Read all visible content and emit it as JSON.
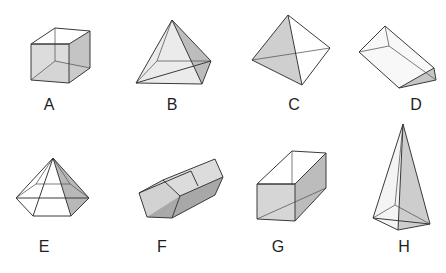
{
  "figure": {
    "colors": {
      "edge": "#3a3a3a",
      "light_face": "#e6e6e6",
      "mid_face": "#d4d4d4",
      "dark_face": "#bdbdbd",
      "background": "#ffffff"
    }
  },
  "shapes": [
    {
      "label": "A",
      "name": "cube"
    },
    {
      "label": "B",
      "name": "square pyramid"
    },
    {
      "label": "C",
      "name": "triangular pyramid (tetrahedron)"
    },
    {
      "label": "D",
      "name": "triangular prism"
    },
    {
      "label": "E",
      "name": "hexagonal pyramid"
    },
    {
      "label": "F",
      "name": "pentagonal prism"
    },
    {
      "label": "G",
      "name": "rectangular prism"
    },
    {
      "label": "H",
      "name": "tall square pyramid"
    }
  ]
}
